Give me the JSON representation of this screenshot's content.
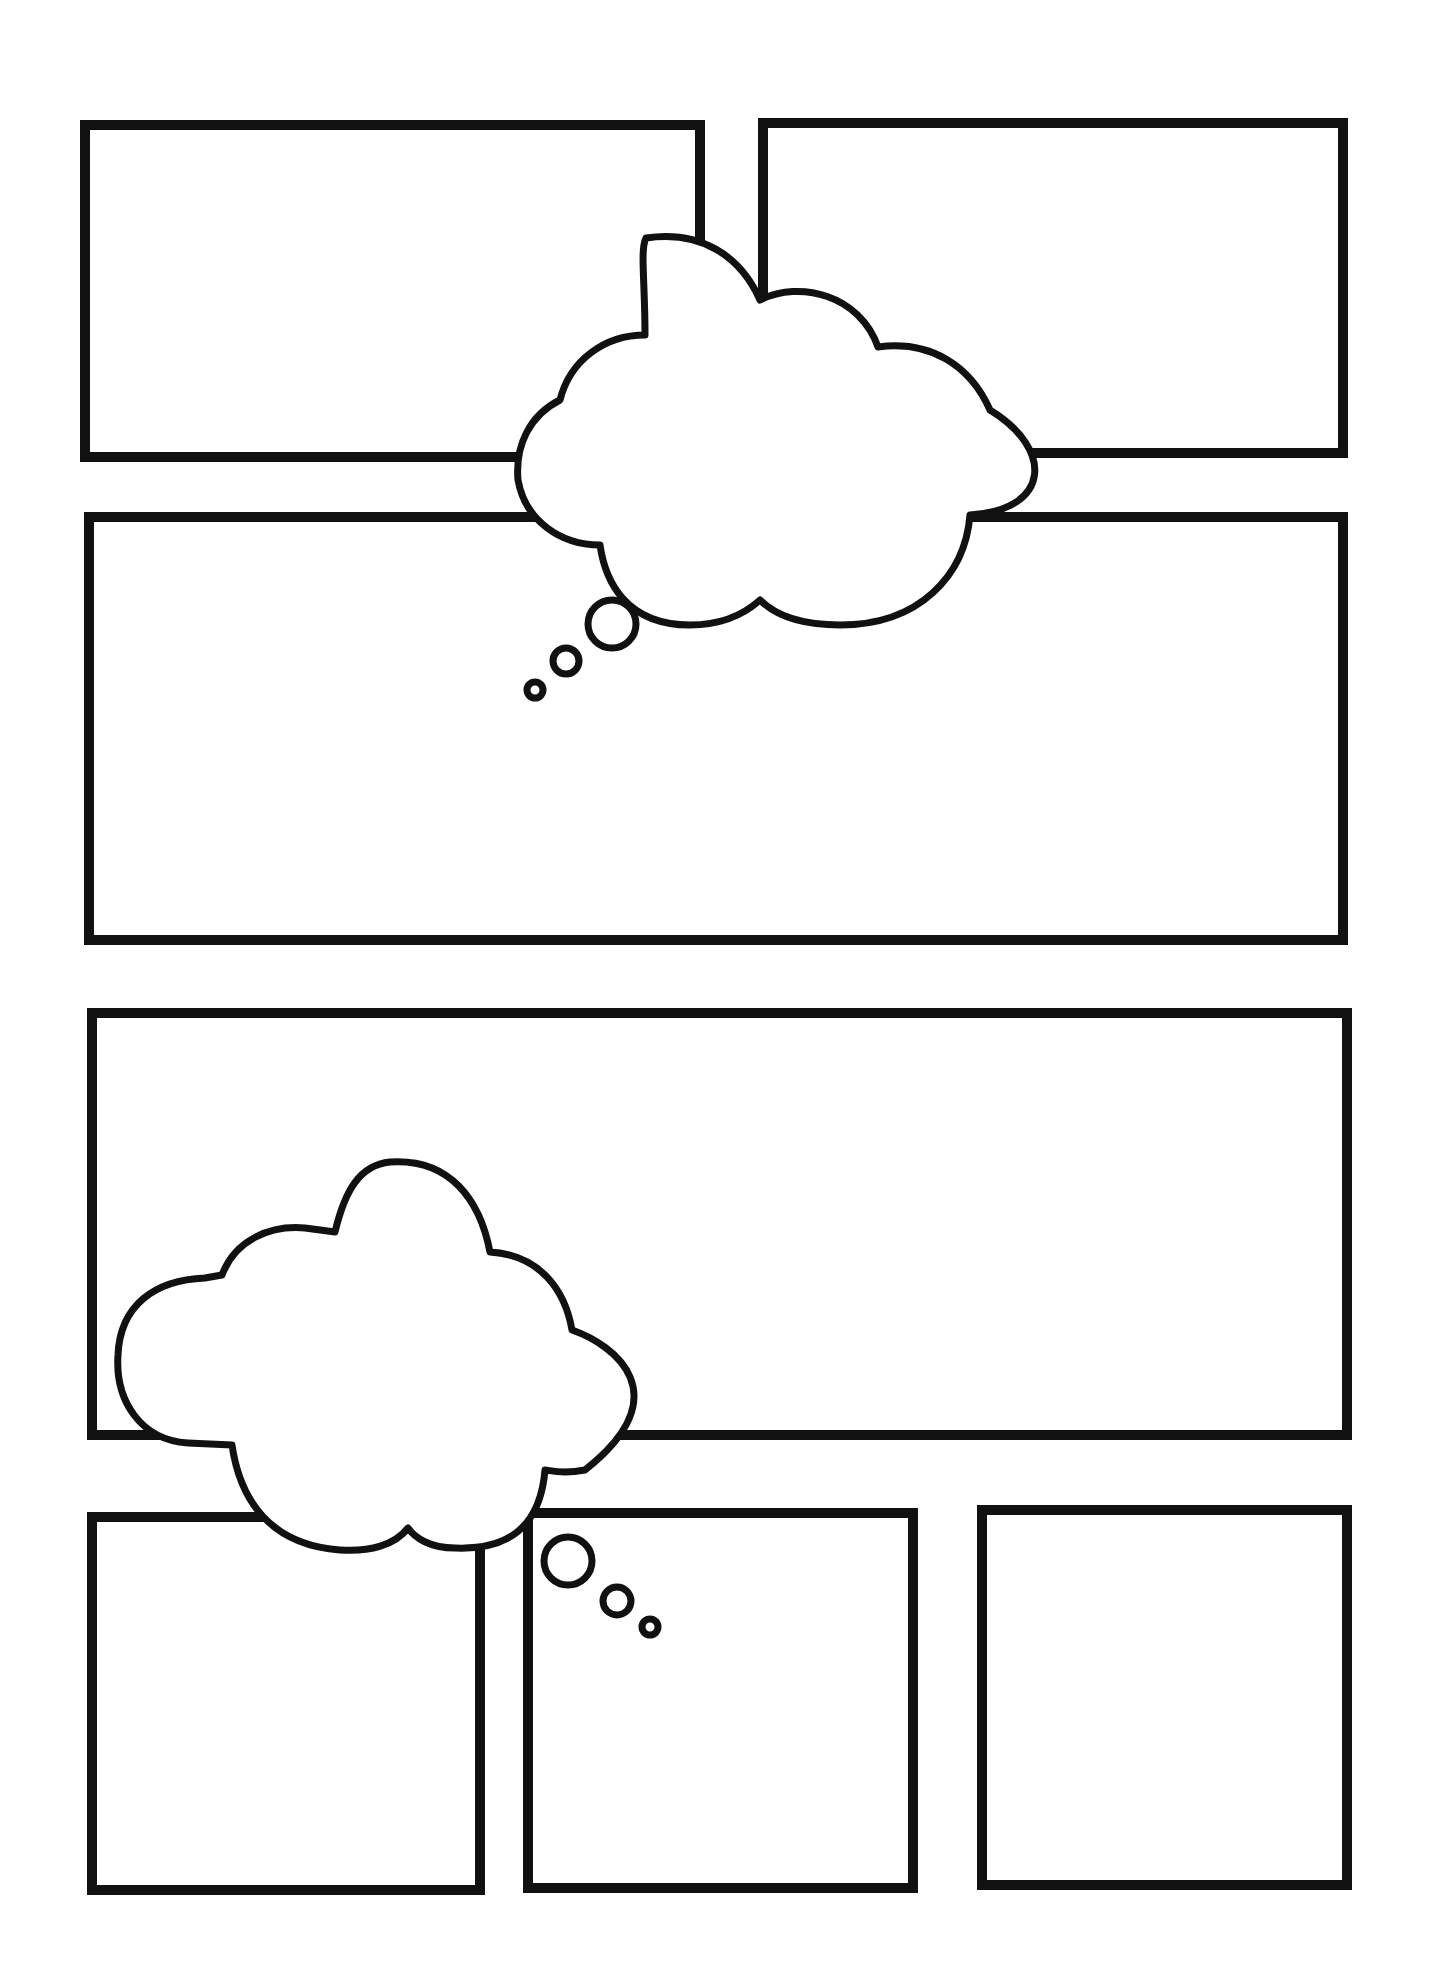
{
  "page": {
    "background": "#ffffff",
    "line_color": "#111111"
  },
  "panels": [
    {
      "id": "panel-1",
      "row": 1,
      "x": 80,
      "y": 120,
      "w": 625,
      "h": 342
    },
    {
      "id": "panel-2",
      "row": 1,
      "x": 758,
      "y": 118,
      "w": 590,
      "h": 340
    },
    {
      "id": "panel-3",
      "row": 2,
      "x": 84,
      "y": 512,
      "w": 1264,
      "h": 433
    },
    {
      "id": "panel-4",
      "row": 3,
      "x": 87,
      "y": 1008,
      "w": 1265,
      "h": 432
    },
    {
      "id": "panel-5",
      "row": 4,
      "x": 87,
      "y": 1512,
      "w": 398,
      "h": 383
    },
    {
      "id": "panel-6",
      "row": 4,
      "x": 523,
      "y": 1508,
      "w": 395,
      "h": 385
    },
    {
      "id": "panel-7",
      "row": 4,
      "x": 977,
      "y": 1505,
      "w": 375,
      "h": 385
    }
  ],
  "thought_bubbles": [
    {
      "id": "thought-cloud-1",
      "text": "",
      "tail_direction": "down-left"
    },
    {
      "id": "thought-cloud-2",
      "text": "",
      "tail_direction": "down-right"
    }
  ]
}
